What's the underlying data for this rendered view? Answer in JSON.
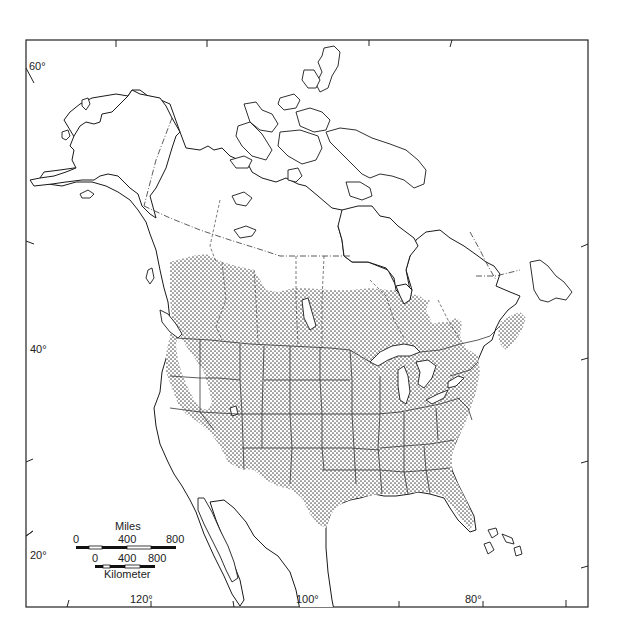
{
  "map": {
    "title": "",
    "subject": "Distribution range map of North America (stippled area)",
    "latitude_labels": [
      "60°",
      "40°",
      "20°"
    ],
    "longitude_labels": [
      "120°",
      "100°",
      "80°"
    ],
    "legend": {
      "stippled_area": "range"
    },
    "scale_bar": {
      "miles": {
        "title": "Miles",
        "ticks": [
          "0",
          "400",
          "800"
        ]
      },
      "kilometers": {
        "title": "Kilometer",
        "ticks": [
          "0",
          "400",
          "800"
        ]
      }
    },
    "colors": {
      "ink": "#1a1a1a",
      "stipple": "#555555",
      "background": "#ffffff"
    }
  }
}
